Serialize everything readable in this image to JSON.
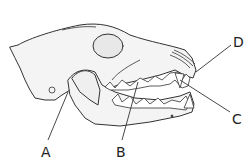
{
  "diagram": {
    "labels": [
      {
        "id": "A",
        "text": "A",
        "x": 41,
        "y": 145
      },
      {
        "id": "B",
        "text": "B",
        "x": 116,
        "y": 145
      },
      {
        "id": "C",
        "text": "C",
        "x": 232,
        "y": 112
      },
      {
        "id": "D",
        "text": "D",
        "x": 233,
        "y": 35
      }
    ],
    "stroke_color": "#333333",
    "fill_color": "#f2f2f2"
  }
}
